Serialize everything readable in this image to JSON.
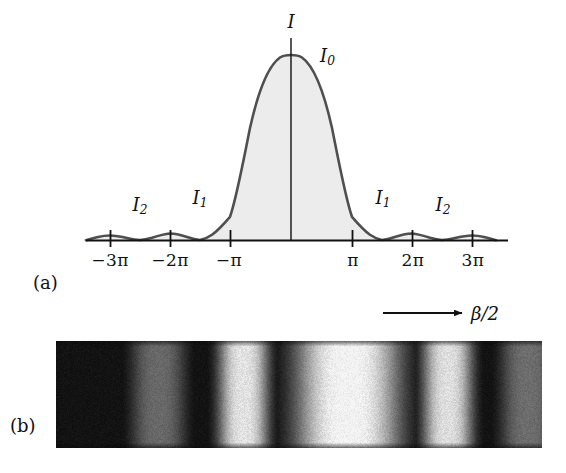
{
  "figure": {
    "panels": [
      {
        "id": "a",
        "caption": "(a)"
      },
      {
        "id": "b",
        "caption": "(b)"
      }
    ]
  },
  "panel_a": {
    "axis_label_y": "I",
    "peak_label": "I",
    "peak_label_sub": "0",
    "secondary_labels": [
      {
        "name": "I",
        "sub": "2",
        "side": "left"
      },
      {
        "name": "I",
        "sub": "1",
        "side": "left"
      },
      {
        "name": "I",
        "sub": "1",
        "side": "right"
      },
      {
        "name": "I",
        "sub": "2",
        "side": "right"
      }
    ],
    "tick_labels": [
      "−3π",
      "−2π",
      "−π",
      "π",
      "2π",
      "3π"
    ],
    "axis_arrow_label": "β/2",
    "curve_stroke_color": "#4a4a4a",
    "curve_fill_color": "#ececec",
    "axis_color": "#111111"
  },
  "chart_data": {
    "type": "line",
    "title": "",
    "subtitle": "",
    "xlabel": "β/2",
    "ylabel": "I",
    "xlim": [
      -3.6,
      3.6
    ],
    "ylim": [
      0,
      1.05
    ],
    "x_unit": "pi",
    "grid": false,
    "legend": "none",
    "x_tick_values": [
      -3,
      -2,
      -1,
      1,
      2,
      3
    ],
    "x_tick_labels": [
      "−3π",
      "−2π",
      "−π",
      "π",
      "2π",
      "3π"
    ],
    "annotations": [
      {
        "text": "I",
        "sub": "0",
        "x": 0.42,
        "y": 0.86,
        "meaning": "central maximum intensity"
      },
      {
        "text": "I",
        "sub": "1",
        "x": -1.43,
        "y": 0.16,
        "meaning": "first secondary maximum (left)"
      },
      {
        "text": "I",
        "sub": "2",
        "x": -2.46,
        "y": 0.12,
        "meaning": "second secondary maximum (left)"
      },
      {
        "text": "I",
        "sub": "1",
        "x": 1.52,
        "y": 0.16,
        "meaning": "first secondary maximum (right)"
      },
      {
        "text": "I",
        "sub": "2",
        "x": 2.54,
        "y": 0.12,
        "meaning": "second secondary maximum (right)"
      },
      {
        "text": "I",
        "sub": "",
        "x": 0.0,
        "y": 1.02,
        "meaning": "intensity axis label"
      }
    ],
    "maxima": [
      {
        "label": "I0",
        "x": 0.0,
        "value": 1.0
      },
      {
        "label": "I1",
        "x": 1.43,
        "value": 0.0472
      },
      {
        "label": "I1",
        "x": -1.43,
        "value": 0.0472
      },
      {
        "label": "I2",
        "x": 2.46,
        "value": 0.0165
      },
      {
        "label": "I2",
        "x": -2.46,
        "value": 0.0165
      }
    ],
    "minima": [
      -3,
      -2,
      -1,
      1,
      2,
      3
    ],
    "series": [
      {
        "name": "I(β/2)",
        "x": [
          -3.6,
          -3.5,
          -3.4,
          -3.3,
          -3.2,
          -3.1,
          -3.0,
          -2.9,
          -2.8,
          -2.7,
          -2.6,
          -2.5,
          -2.4,
          -2.3,
          -2.2,
          -2.1,
          -2.0,
          -1.9,
          -1.8,
          -1.7,
          -1.6,
          -1.5,
          -1.4,
          -1.3,
          -1.2,
          -1.1,
          -1.0,
          -0.9,
          -0.8,
          -0.7,
          -0.6,
          -0.5,
          -0.4,
          -0.3,
          -0.2,
          -0.1,
          0.0,
          0.1,
          0.2,
          0.3,
          0.4,
          0.5,
          0.6,
          0.7,
          0.8,
          0.9,
          1.0,
          1.1,
          1.2,
          1.3,
          1.4,
          1.5,
          1.6,
          1.7,
          1.8,
          1.9,
          2.0,
          2.1,
          2.2,
          2.3,
          2.4,
          2.5,
          2.6,
          2.7,
          2.8,
          2.9,
          3.0,
          3.1,
          3.2,
          3.3,
          3.4,
          3.5,
          3.6
        ],
        "y": [
          0.0068,
          0.0074,
          0.0059,
          0.0031,
          0.0008,
          0.0,
          0.0,
          0.0009,
          0.0034,
          0.0066,
          0.0094,
          0.0107,
          0.01,
          0.0074,
          0.0039,
          0.001,
          0.0,
          0.0011,
          0.0043,
          0.0088,
          0.0134,
          0.0166,
          0.0172,
          0.0147,
          0.0096,
          0.0036,
          0.0,
          0.0099,
          0.0393,
          0.0865,
          0.1471,
          0.2122,
          0.2749,
          0.3333,
          0.3825,
          0.4163,
          0.43,
          0.4163,
          0.3825,
          0.3333,
          0.2749,
          0.2122,
          0.1471,
          0.0865,
          0.0393,
          0.0099,
          0.0,
          0.0036,
          0.0096,
          0.0147,
          0.0172,
          0.0166,
          0.0134,
          0.0088,
          0.0043,
          0.0011,
          0.0,
          0.001,
          0.0039,
          0.0074,
          0.01,
          0.0107,
          0.0094,
          0.0066,
          0.0034,
          0.0009,
          0.0,
          0.0,
          0.0008,
          0.0031,
          0.0059,
          0.0074,
          0.0068
        ]
      }
    ],
    "note": "y values above are normalized to the drawn figure height where the central peak is drawn at 1.0 and side lobes exaggerated for visibility"
  },
  "panel_b": {
    "caption": "(b)",
    "description": "photograph of single-slit diffraction fringes",
    "background_color": "#0a0a0a",
    "fringe_color": "#f2f2f2",
    "bands": [
      {
        "order": -2,
        "center_pct": 21.0,
        "half_width_pct": 5.5,
        "brightness": 0.4
      },
      {
        "order": -1,
        "center_pct": 38.5,
        "half_width_pct": 5.0,
        "brightness": 0.92
      },
      {
        "order": 0,
        "center_pct": 60.0,
        "half_width_pct": 10.5,
        "brightness": 1.0
      },
      {
        "order": 1,
        "center_pct": 80.5,
        "half_width_pct": 5.0,
        "brightness": 0.9
      },
      {
        "order": 2,
        "center_pct": 97.0,
        "half_width_pct": 5.5,
        "brightness": 0.42
      }
    ]
  }
}
